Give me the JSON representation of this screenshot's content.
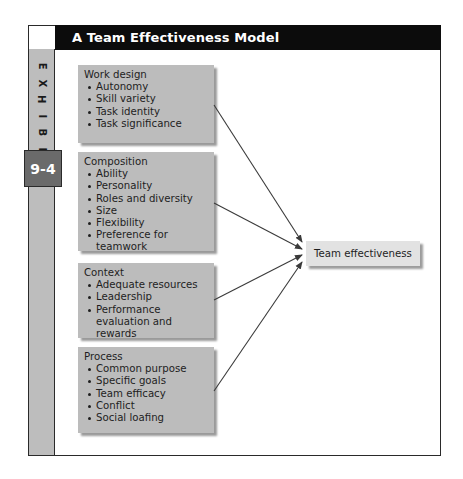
{
  "exhibit": {
    "title": "A Team Effectiveness Model",
    "label_letters": [
      "E",
      "X",
      "H",
      "I",
      "B",
      "I",
      "T"
    ],
    "number": "9-4"
  },
  "factors": [
    {
      "title": "Work design",
      "items": [
        "Autonomy",
        "Skill variety",
        "Task identity",
        "Task significance"
      ]
    },
    {
      "title": "Composition",
      "items": [
        "Ability",
        "Personality",
        "Roles and diversity",
        "Size",
        "Flexibility",
        "Preference for teamwork"
      ]
    },
    {
      "title": "Context",
      "items": [
        "Adequate resources",
        "Leadership",
        "Performance evaluation and rewards"
      ]
    },
    {
      "title": "Process",
      "items": [
        "Common purpose",
        "Specific goals",
        "Team efficacy",
        "Conflict",
        "Social loafing"
      ]
    }
  ],
  "outcome": {
    "label": "Team effectiveness"
  },
  "connections": [
    {
      "from": "Work design",
      "to": "Team effectiveness"
    },
    {
      "from": "Composition",
      "to": "Team effectiveness"
    },
    {
      "from": "Context",
      "to": "Team effectiveness"
    },
    {
      "from": "Process",
      "to": "Team effectiveness"
    }
  ],
  "colors": {
    "header_bg": "#0c0c0c",
    "sidebar_bg": "#bdbdbd",
    "badge_bg": "#6a6a6a",
    "factor_box_bg": "#bcbcbc",
    "outcome_box_bg": "#e2e2e2",
    "arrow": "#3a3a3a"
  }
}
